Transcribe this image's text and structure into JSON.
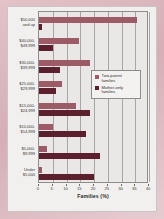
{
  "chart_data": {
    "type": "bar",
    "orientation": "horizontal",
    "title": "",
    "xlabel": "Families (%)",
    "ylabel": "",
    "xlim": [
      0,
      40
    ],
    "xticks": [
      0,
      5,
      10,
      15,
      20,
      25,
      30,
      35,
      40
    ],
    "xtick_labels": [
      "0",
      "5",
      "10",
      "15",
      "20",
      "25",
      "30",
      "35",
      "40"
    ],
    "grid": "vertical",
    "legend_position": "center-right",
    "categories": [
      "$50,000 and up",
      "$40,000-$49,999",
      "$30,000-$39,999",
      "$25,000-$29,999",
      "$15,000-$24,999",
      "$10,000-$14,999",
      "$5,000-$9,999",
      "Under $5,000"
    ],
    "category_lines": [
      [
        "$50,000",
        "and up"
      ],
      [
        "$40,000-",
        "$49,999"
      ],
      [
        "$30,000-",
        "$39,999"
      ],
      [
        "$25,000-",
        "$29,999"
      ],
      [
        "$15,000-",
        "$24,999"
      ],
      [
        "$10,000-",
        "$14,999"
      ],
      [
        "$5,000-",
        "$9,999"
      ],
      [
        "Under",
        "$5,000"
      ]
    ],
    "series": [
      {
        "name": "Two-parent families",
        "name_lines": [
          "Two-parent",
          "families"
        ],
        "color": "#9d5a67",
        "values": [
          35.5,
          14.5,
          18.5,
          8.5,
          13.5,
          5.0,
          3.0,
          1.0
        ]
      },
      {
        "name": "Mother-only families",
        "name_lines": [
          "Mother-only",
          "families"
        ],
        "color": "#5c1f2d",
        "values": [
          1.0,
          5.0,
          7.5,
          6.0,
          18.5,
          17.0,
          22.0,
          20.0
        ]
      }
    ]
  },
  "colors": {
    "two_parent": "#9d5a67",
    "mother_only": "#5c1f2d",
    "plot_background": "#e9e8e6",
    "gridline": "#a8a6a4",
    "frame": "#d9b7bd",
    "plate": "#f2f0ee"
  }
}
